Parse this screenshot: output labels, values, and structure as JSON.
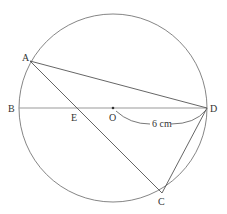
{
  "diagram": {
    "labels": {
      "A": "A",
      "B": "B",
      "C": "C",
      "D": "D",
      "E": "E",
      "O": "O",
      "radius": "6 cm"
    },
    "colors": {
      "stroke": "#555555",
      "diameter": "#888888",
      "text": "#333333"
    }
  }
}
